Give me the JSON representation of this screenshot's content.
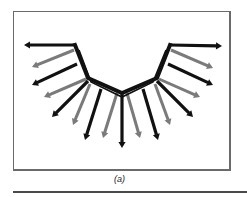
{
  "figure": {
    "caption": "(a)",
    "colors": {
      "frame": "#6a6a6a",
      "black_arrow": "#111111",
      "gray_arrow": "#7a7a7a",
      "curve": "#111111",
      "rule": "#4a4a4a"
    },
    "curve": {
      "outer": [
        [
          75,
          45
        ],
        [
          88,
          78
        ],
        [
          122,
          93
        ],
        [
          157,
          78
        ],
        [
          170,
          45
        ]
      ],
      "inner": [
        [
          79,
          50
        ],
        [
          91,
          82
        ],
        [
          122,
          97
        ],
        [
          153,
          82
        ],
        [
          166,
          50
        ]
      ]
    },
    "arrows": [
      {
        "from": [
          75,
          45
        ],
        "to": [
          24,
          45
        ],
        "shade": "black"
      },
      {
        "from": [
          74,
          50
        ],
        "to": [
          32,
          67
        ],
        "shade": "gray"
      },
      {
        "from": [
          77,
          64
        ],
        "to": [
          32,
          85
        ],
        "shade": "black"
      },
      {
        "from": [
          86,
          79
        ],
        "to": [
          44,
          97
        ],
        "shade": "gray"
      },
      {
        "from": [
          88,
          81
        ],
        "to": [
          52,
          117
        ],
        "shade": "black"
      },
      {
        "from": [
          90,
          84
        ],
        "to": [
          73,
          125
        ],
        "shade": "gray"
      },
      {
        "from": [
          101,
          89
        ],
        "to": [
          85,
          140
        ],
        "shade": "black"
      },
      {
        "from": [
          117,
          93
        ],
        "to": [
          103,
          138
        ],
        "shade": "gray"
      },
      {
        "from": [
          122,
          94
        ],
        "to": [
          122,
          148
        ],
        "shade": "black"
      },
      {
        "from": [
          127,
          93
        ],
        "to": [
          140,
          138
        ],
        "shade": "gray"
      },
      {
        "from": [
          143,
          89
        ],
        "to": [
          158,
          140
        ],
        "shade": "black"
      },
      {
        "from": [
          155,
          84
        ],
        "to": [
          170,
          125
        ],
        "shade": "gray"
      },
      {
        "from": [
          157,
          81
        ],
        "to": [
          193,
          117
        ],
        "shade": "black"
      },
      {
        "from": [
          159,
          79
        ],
        "to": [
          200,
          97
        ],
        "shade": "gray"
      },
      {
        "from": [
          168,
          64
        ],
        "to": [
          213,
          85
        ],
        "shade": "black"
      },
      {
        "from": [
          171,
          50
        ],
        "to": [
          213,
          68
        ],
        "shade": "gray"
      },
      {
        "from": [
          170,
          45
        ],
        "to": [
          222,
          46
        ],
        "shade": "black"
      }
    ]
  }
}
